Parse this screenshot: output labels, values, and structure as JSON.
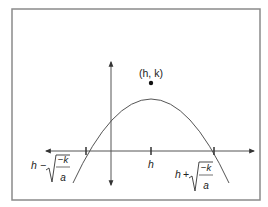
{
  "diagram": {
    "type": "parabola",
    "vertex_label": "(h, k)",
    "axis_tick_label": "h",
    "left_root": {
      "prefix": "h",
      "operator": "−",
      "numerator": "−k",
      "denominator": "a"
    },
    "right_root": {
      "prefix": "h",
      "operator": "+",
      "numerator": "−k",
      "denominator": "a"
    },
    "colors": {
      "frame": "#8a8a8a",
      "axes": "#444444",
      "curve": "#555555",
      "point": "#111111",
      "text": "#222222"
    }
  }
}
